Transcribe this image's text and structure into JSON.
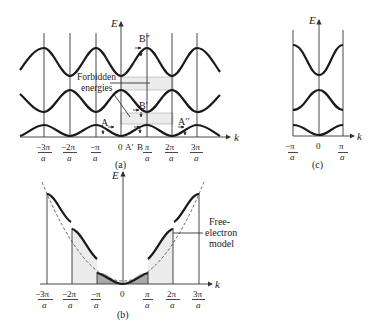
{
  "panels": {
    "a": {
      "label": "(a)",
      "y_axis": "E",
      "x_axis": "k",
      "ticks": [
        {
          "num": "−3π",
          "den": "a"
        },
        {
          "num": "−2π",
          "den": "a"
        },
        {
          "num": "−π",
          "den": "a"
        },
        {
          "num": "0",
          "den": ""
        },
        {
          "num": "π",
          "den": "a"
        },
        {
          "num": "2π",
          "den": "a"
        },
        {
          "num": "3π",
          "den": "a"
        }
      ],
      "annotations": {
        "forbidden_line1": "Forbidden",
        "forbidden_line2": "energies",
        "A": "A",
        "A_prime": "A′",
        "A_double_prime": "A′′",
        "B": "B",
        "B_prime": "B′",
        "B_double_prime": "B′′"
      }
    },
    "b": {
      "label": "(b)",
      "y_axis": "E",
      "x_axis": "k",
      "ticks": [
        {
          "num": "−3π",
          "den": "a"
        },
        {
          "num": "−2π",
          "den": "a"
        },
        {
          "num": "−π",
          "den": "a"
        },
        {
          "num": "0",
          "den": ""
        },
        {
          "num": "π",
          "den": "a"
        },
        {
          "num": "2π",
          "den": "a"
        },
        {
          "num": "3π",
          "den": "a"
        }
      ],
      "annotations": {
        "free_line1": "Free-",
        "free_line2": "electron",
        "free_line3": "model"
      }
    },
    "c": {
      "label": "(c)",
      "y_axis": "E",
      "x_axis": "k",
      "ticks": [
        {
          "num": "−π",
          "den": "a"
        },
        {
          "num": "0",
          "den": ""
        },
        {
          "num": "π",
          "den": "a"
        }
      ]
    }
  }
}
